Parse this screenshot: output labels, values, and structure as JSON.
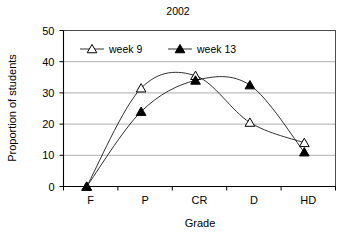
{
  "chart_data": {
    "type": "line",
    "title": "2002",
    "xlabel": "Grade",
    "ylabel": "Proportion of students",
    "categories": [
      "F",
      "P",
      "CR",
      "D",
      "HD"
    ],
    "ylim": [
      0,
      50
    ],
    "yticks": [
      0,
      10,
      20,
      30,
      40,
      50
    ],
    "grid": true,
    "legend_position": "top-left-inside",
    "series": [
      {
        "name": "week 9",
        "marker": "open-triangle",
        "values": [
          0,
          31.5,
          35.5,
          20.5,
          14
        ]
      },
      {
        "name": "week 13",
        "marker": "filled-triangle",
        "values": [
          0,
          24,
          34,
          32.5,
          11
        ]
      }
    ]
  }
}
